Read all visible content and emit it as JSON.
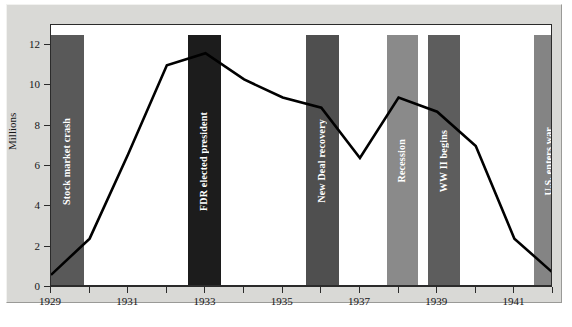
{
  "chart_data": {
    "type": "line",
    "title": "",
    "subtitle": "",
    "xlabel": "",
    "ylabel": "Millions",
    "xlim": [
      1929,
      1942
    ],
    "ylim": [
      0,
      13
    ],
    "yticks": [
      0,
      2,
      4,
      6,
      8,
      10,
      12
    ],
    "ytick_labels": [
      "0",
      "2",
      "4",
      "6",
      "8",
      "10",
      "12"
    ],
    "xticks": [
      1929,
      1930,
      1931,
      1932,
      1933,
      1934,
      1935,
      1936,
      1937,
      1938,
      1939,
      1940,
      1941,
      1942
    ],
    "xtick_labels": [
      "1929",
      "1931",
      "1933",
      "1935",
      "1937",
      "1939",
      "1941"
    ],
    "labeled_xticks": [
      1929,
      1931,
      1933,
      1935,
      1937,
      1939,
      1941
    ],
    "grid": false,
    "legend": "none",
    "series": [
      {
        "name": "Unemployment",
        "color": "#000000",
        "x": [
          1929,
          1930,
          1931,
          1932,
          1933,
          1934,
          1935,
          1936,
          1937,
          1938,
          1939,
          1940,
          1941,
          1942
        ],
        "values": [
          0.6,
          2.4,
          6.6,
          11.0,
          11.6,
          10.3,
          9.4,
          8.9,
          6.4,
          9.4,
          8.7,
          7.0,
          2.4,
          0.7
        ]
      }
    ],
    "annotations": [
      {
        "label": "Stock market crash",
        "x_start": 1929.0,
        "x_end": 1929.85,
        "color": "#595959",
        "top_value": 12.5
      },
      {
        "label": "FDR elected president",
        "x_start": 1932.55,
        "x_end": 1933.4,
        "color": "#1c1c1c",
        "top_value": 12.5
      },
      {
        "label": "New Deal recovery",
        "x_start": 1935.6,
        "x_end": 1936.45,
        "color": "#4f4f4f",
        "top_value": 12.5
      },
      {
        "label": "Recession",
        "x_start": 1937.7,
        "x_end": 1938.5,
        "color": "#8a8a8a",
        "top_value": 12.5
      },
      {
        "label": "WW II begins",
        "x_start": 1938.75,
        "x_end": 1939.6,
        "color": "#5d5d5d",
        "top_value": 12.5
      },
      {
        "label": "U.S. enters war",
        "x_start": 1941.5,
        "x_end": 1942.3,
        "color": "#848484",
        "top_value": 12.5
      }
    ]
  },
  "figure": {
    "background_color": "#d9d9d6",
    "plot_background_color": "#ffffff",
    "axis_color": "#2b2b2b"
  }
}
